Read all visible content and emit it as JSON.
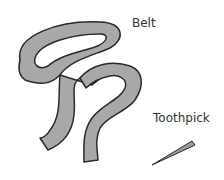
{
  "labels": {
    "belt": "Belt",
    "toothpick": "Toothpick"
  },
  "colors": {
    "belt_fill": "#a8a8a8",
    "belt_outline": "#2a2a2a",
    "toothpick_fill": "#9a9a9a"
  },
  "objects": [
    {
      "name": "belt",
      "icon": "belt-illustration"
    },
    {
      "name": "toothpick",
      "icon": "toothpick-illustration"
    }
  ]
}
